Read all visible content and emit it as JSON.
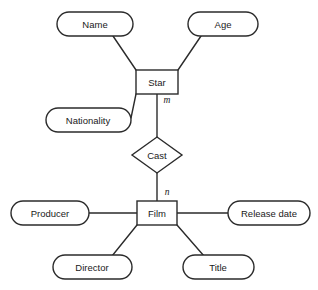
{
  "diagram": {
    "type": "entity-relationship-diagram",
    "notation": "chen",
    "background_color": "#ffffff",
    "stroke_color": "#2b2b2b",
    "fill_color": "#ffffff",
    "entities": [
      {
        "id": "star",
        "label": "Star",
        "shape": "rectangle",
        "x": 157,
        "y": 82,
        "width": 42,
        "height": 24
      },
      {
        "id": "film",
        "label": "Film",
        "shape": "rectangle",
        "x": 157,
        "y": 213,
        "width": 40,
        "height": 24
      }
    ],
    "relationships": [
      {
        "id": "cast",
        "label": "Cast",
        "shape": "diamond",
        "x": 157,
        "y": 155,
        "width": 50,
        "height": 36
      }
    ],
    "attributes": [
      {
        "id": "name",
        "label": "Name",
        "shape": "rounded-rectangle",
        "owner": "star",
        "x": 95,
        "y": 24,
        "width": 76,
        "height": 24
      },
      {
        "id": "age",
        "label": "Age",
        "shape": "rounded-rectangle",
        "owner": "star",
        "x": 223,
        "y": 24,
        "width": 70,
        "height": 24
      },
      {
        "id": "nationality",
        "label": "Nationality",
        "shape": "rounded-rectangle",
        "owner": "star",
        "x": 88,
        "y": 120,
        "width": 85,
        "height": 24
      },
      {
        "id": "producer",
        "label": "Producer",
        "shape": "rounded-rectangle",
        "owner": "film",
        "x": 50,
        "y": 213,
        "width": 78,
        "height": 24
      },
      {
        "id": "release-date",
        "label": "Release date",
        "shape": "rounded-rectangle",
        "owner": "film",
        "x": 269,
        "y": 213,
        "width": 82,
        "height": 24
      },
      {
        "id": "director",
        "label": "Director",
        "shape": "rounded-rectangle",
        "owner": "film",
        "x": 92,
        "y": 267,
        "width": 79,
        "height": 24
      },
      {
        "id": "title",
        "label": "Title",
        "shape": "rounded-rectangle",
        "owner": "film",
        "x": 218,
        "y": 267,
        "width": 71,
        "height": 24
      }
    ],
    "cardinalities": [
      {
        "id": "star-cast",
        "label": "m",
        "from": "star",
        "to": "cast",
        "x": 166,
        "y": 101
      },
      {
        "id": "cast-film",
        "label": "n",
        "from": "cast",
        "to": "film",
        "x": 166,
        "y": 193
      }
    ],
    "connectors": [
      {
        "id": "name-star",
        "x1": 113,
        "y1": 36,
        "x2": 136,
        "y2": 70
      },
      {
        "id": "age-star",
        "x1": 201,
        "y1": 36,
        "x2": 178,
        "y2": 70
      },
      {
        "id": "nationality-star",
        "x1": 131,
        "y1": 118,
        "x2": 136,
        "y2": 94
      },
      {
        "id": "star-cast-line",
        "x1": 157,
        "y1": 94,
        "x2": 157,
        "y2": 137
      },
      {
        "id": "cast-film-line",
        "x1": 157,
        "y1": 173,
        "x2": 157,
        "y2": 201
      },
      {
        "id": "producer-film",
        "x1": 89,
        "y1": 213,
        "x2": 137,
        "y2": 213
      },
      {
        "id": "film-release-date",
        "x1": 177,
        "y1": 213,
        "x2": 228,
        "y2": 213
      },
      {
        "id": "film-director",
        "x1": 137,
        "y1": 225,
        "x2": 112,
        "y2": 256
      },
      {
        "id": "film-title",
        "x1": 177,
        "y1": 225,
        "x2": 204,
        "y2": 256
      }
    ]
  }
}
